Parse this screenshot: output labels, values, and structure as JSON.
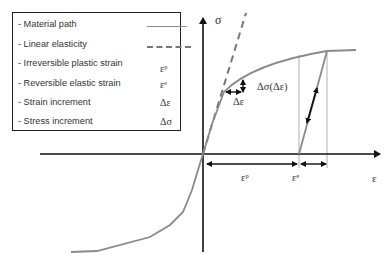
{
  "legend": {
    "items": [
      {
        "label": "- Material path",
        "symbol": "",
        "style": "solid"
      },
      {
        "label": "- Linear elasticity",
        "symbol": "",
        "style": "dashed"
      },
      {
        "label": "- Irreversible plastic strain",
        "symbol": "εᵖ"
      },
      {
        "label": "- Reversible elastic strain",
        "symbol": "εᵉ"
      },
      {
        "label": "- Strain increment",
        "symbol": "Δε"
      },
      {
        "label": "- Stress increment",
        "symbol": "Δσ"
      }
    ]
  },
  "axes": {
    "y_label": "σ",
    "x_label": "ε"
  },
  "annotations": {
    "stress_increment_fn": "Δσ(Δε)",
    "strain_increment": "Δε",
    "plastic_strain": "εᵖ",
    "elastic_strain": "εᵉ"
  },
  "colors": {
    "axis": "#111111",
    "curve": "#8a8a8a",
    "guide": "#b0b0b0",
    "text": "#333333"
  }
}
